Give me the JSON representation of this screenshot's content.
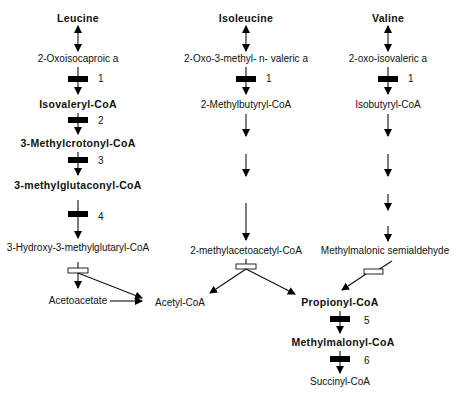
{
  "diagram": {
    "type": "metabolic-pathway",
    "columns": [
      {
        "name": "leucine",
        "nodes": [
          {
            "label": "Leucine",
            "bold": true
          },
          {
            "label": "2-Oxoisocaproic a",
            "bold": false
          },
          {
            "label": "Isovaleryl-CoA",
            "bold": true
          },
          {
            "label": "3-Methylcrotonyl-CoA",
            "bold": true
          },
          {
            "label": "3-methylglutaconyl-CoA",
            "bold": true
          },
          {
            "label": "3-Hydroxy-3-methylglutaryl-CoA",
            "bold": false
          },
          {
            "label": "Acetoacetate",
            "bold": false
          }
        ],
        "enzymes": [
          "1",
          "2",
          "3",
          "4"
        ]
      },
      {
        "name": "isoleucine",
        "nodes": [
          {
            "label": "Isoleucine",
            "bold": true
          },
          {
            "label": "2-Oxo-3-methyl- n- valeric a",
            "bold": false
          },
          {
            "label": "2-Methylbutyryl-CoA",
            "bold": false
          },
          {
            "label": "2-methylacetoacetyl-CoA",
            "bold": false
          },
          {
            "label": "Acetyl-CoA",
            "bold": false
          }
        ],
        "enzymes": [
          "1"
        ]
      },
      {
        "name": "valine",
        "nodes": [
          {
            "label": "Valine",
            "bold": true
          },
          {
            "label": "2-oxo-isovaleric a",
            "bold": false
          },
          {
            "label": "Isobutyryl-CoA",
            "bold": false
          },
          {
            "label": "Methylmalonic semialdehyde",
            "bold": false
          },
          {
            "label": "Propionyl-CoA",
            "bold": true
          },
          {
            "label": "Methylmalonyl-CoA",
            "bold": true
          },
          {
            "label": "Succinyl-CoA",
            "bold": false
          }
        ],
        "enzymes": [
          "1",
          "5",
          "6"
        ]
      }
    ],
    "colors": {
      "ink": "#111111",
      "background": "#ffffff"
    }
  }
}
